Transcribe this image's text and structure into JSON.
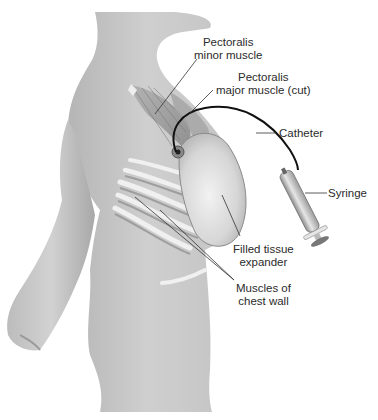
{
  "diagram": {
    "labels": {
      "pec_minor": {
        "line1": "Pectoralis",
        "line2": "minor muscle"
      },
      "pec_major": {
        "line1": "Pectoralis",
        "line2": "major muscle (cut)"
      },
      "catheter": "Catheter",
      "syringe": "Syringe",
      "expander": {
        "line1": "Filled tissue",
        "line2": "expander"
      },
      "chest_wall": {
        "line1": "Muscles of",
        "line2": "chest wall"
      }
    },
    "colors": {
      "background": "#ffffff",
      "skin": "#c9c9c9",
      "skin_shadow": "#a9a9a9",
      "muscle": "#9a9a9a",
      "rib": "#e8e8e8",
      "expander": "#dcdcdc",
      "catheter": "#111111",
      "leader_line": "#333333",
      "text": "#2b2b2b"
    }
  }
}
